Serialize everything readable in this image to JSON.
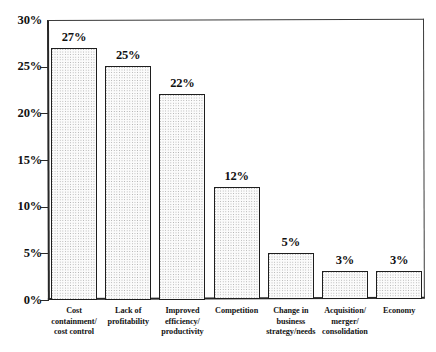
{
  "chart_data": {
    "type": "bar",
    "title": "",
    "subtitle": "",
    "xlabel": "",
    "ylabel": "",
    "ylim": [
      0,
      30
    ],
    "ytick_labels": [
      "0%",
      "5%",
      "10%",
      "15%",
      "20%",
      "25%",
      "30%"
    ],
    "ytick_values": [
      0,
      5,
      10,
      15,
      20,
      25,
      30
    ],
    "grid": false,
    "legend": false,
    "value_label_suffix": "%",
    "categories": [
      "Cost\ncontainment/\ncost control",
      "Lack of\nprofitability",
      "Improved\nefficiency/\nproductivity",
      "Competition",
      "Change in\nbusiness\nstrategy/needs",
      "Acquisition/\nmerger/\nconsolidation",
      "Economy"
    ],
    "values": [
      27,
      25,
      22,
      12,
      5,
      3,
      3
    ],
    "value_labels": [
      "27%",
      "25%",
      "22%",
      "12%",
      "5%",
      "3%",
      "3%"
    ]
  },
  "style": {
    "bar_fill": "#fbfbfb",
    "bar_pattern_dot": "#a8a8a8",
    "bar_outline": "#1e1e1e",
    "axis_color": "#262626",
    "text_color": "#111111",
    "background": "#ffffff"
  }
}
